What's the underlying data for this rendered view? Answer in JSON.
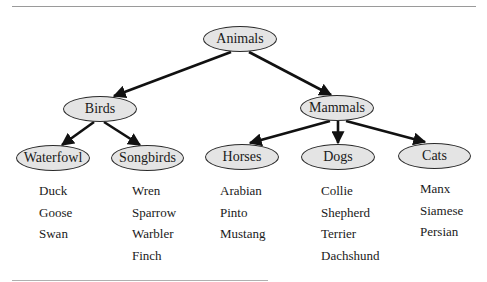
{
  "diagram": {
    "type": "tree",
    "root": {
      "id": "animals",
      "label": "Animals"
    },
    "nodes": [
      {
        "id": "animals",
        "label": "Animals",
        "cx": 240,
        "cy": 39,
        "w": 74,
        "h": 26
      },
      {
        "id": "birds",
        "label": "Birds",
        "cx": 100,
        "cy": 109,
        "w": 74,
        "h": 25
      },
      {
        "id": "mammals",
        "label": "Mammals",
        "cx": 337,
        "cy": 108,
        "w": 74,
        "h": 26
      },
      {
        "id": "waterfowl",
        "label": "Waterfowl",
        "cx": 53,
        "cy": 159,
        "w": 74,
        "h": 26
      },
      {
        "id": "songbirds",
        "label": "Songbirds",
        "cx": 147,
        "cy": 158,
        "w": 73,
        "h": 26
      },
      {
        "id": "horses",
        "label": "Horses",
        "cx": 242,
        "cy": 157,
        "w": 74,
        "h": 26
      },
      {
        "id": "dogs",
        "label": "Dogs",
        "cx": 338,
        "cy": 157,
        "w": 74,
        "h": 26
      },
      {
        "id": "cats",
        "label": "Cats",
        "cx": 434,
        "cy": 156,
        "w": 73,
        "h": 26
      }
    ],
    "edges": [
      {
        "from": "animals",
        "to": "birds"
      },
      {
        "from": "animals",
        "to": "mammals"
      },
      {
        "from": "birds",
        "to": "waterfowl"
      },
      {
        "from": "birds",
        "to": "songbirds"
      },
      {
        "from": "mammals",
        "to": "horses"
      },
      {
        "from": "mammals",
        "to": "dogs"
      },
      {
        "from": "mammals",
        "to": "cats"
      }
    ],
    "leaves": {
      "waterfowl": [
        "Duck",
        "Goose",
        "Swan"
      ],
      "songbirds": [
        "Wren",
        "Sparrow",
        "Warbler",
        "Finch"
      ],
      "horses": [
        "Arabian",
        "Pinto",
        "Mustang"
      ],
      "dogs": [
        "Collie",
        "Shepherd",
        "Terrier",
        "Dachshund"
      ],
      "cats": [
        "Manx",
        "Siamese",
        "Persian"
      ]
    }
  },
  "colors": {
    "node_fill": "#e4e4e4",
    "node_border": "#2a2a2a",
    "edge": "#111111",
    "rule": "#9a9a9a"
  }
}
